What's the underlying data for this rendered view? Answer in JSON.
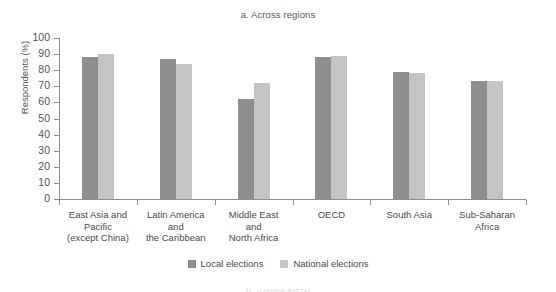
{
  "chart_data": {
    "type": "bar",
    "title": "a. Across regions",
    "xlabel": "",
    "ylabel": "Respondents (%)",
    "ylim": [
      0,
      100
    ],
    "ytick_step": 10,
    "yticks": [
      100,
      90,
      80,
      70,
      60,
      50,
      40,
      30,
      20,
      10,
      0
    ],
    "grid": false,
    "legend_position": "bottom-center",
    "categories": [
      "East Asia and\nPacific\n(except China)",
      "Latin America\nand\nthe Caribbean",
      "Middle East\nand\nNorth Africa",
      "OECD",
      "South Asia",
      "Sub-Saharan\nAfrica"
    ],
    "series": [
      {
        "name": "Local elections",
        "color": "#8e8e8e",
        "values": [
          88,
          87,
          62,
          88,
          79,
          73
        ]
      },
      {
        "name": "National elections",
        "color": "#c4c4c4",
        "values": [
          90,
          84,
          72,
          89,
          78,
          73
        ]
      }
    ]
  },
  "categories_lines": [
    [
      "East Asia and",
      "Pacific",
      "(except China)"
    ],
    [
      "Latin America",
      "and",
      "the Caribbean"
    ],
    [
      "Middle East",
      "and",
      "North Africa"
    ],
    [
      "OECD"
    ],
    [
      "South Asia"
    ],
    [
      "Sub-Saharan",
      "Africa"
    ]
  ],
  "legend": [
    {
      "label": "Local elections",
      "color": "#8e8e8e"
    },
    {
      "label": "National elections",
      "color": "#c4c4c4"
    }
  ],
  "next_panel": {
    "title": "b. Across NEW"
  }
}
